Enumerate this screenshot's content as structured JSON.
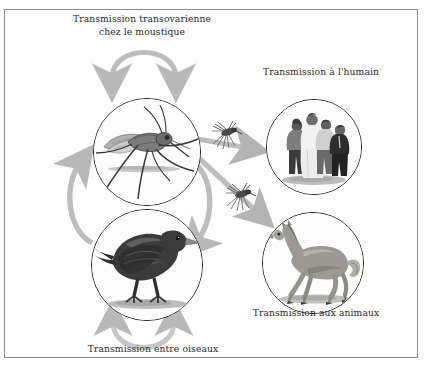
{
  "diagram": {
    "title_text": "Cycle de transmission du virus du Nil occidental",
    "background_color": "#ffffff",
    "border_color": "#8b8b8b",
    "arrow_color": "#b9b9b9",
    "arrow_color_dark": "#a3a3a3",
    "text_color": "#2a2a2a",
    "labels": [
      {
        "id": "transovarial",
        "line1": "Transmission transovarienne",
        "line2": "chez le moustique",
        "full": "Transmission transovarienne chez le moustique"
      },
      {
        "id": "human",
        "line1": "Transmission à l'humain",
        "line2": "",
        "full": "Transmission à l'humain"
      },
      {
        "id": "animals",
        "line1": "Transmission aux animaux",
        "line2": "",
        "full": "Transmission aux animaux"
      },
      {
        "id": "birds",
        "line1": "Transmission entre oiseaux",
        "line2": "",
        "full": "Transmission entre oiseaux"
      }
    ],
    "nodes": [
      {
        "id": "mosquito",
        "icon": "mosquito-photo-icon",
        "alt": "Moustique"
      },
      {
        "id": "bird",
        "icon": "crow-photo-icon",
        "alt": "Oiseau (corneille)"
      },
      {
        "id": "humans",
        "icon": "people-group-photo-icon",
        "alt": "Groupe de personnes"
      },
      {
        "id": "horse",
        "icon": "horse-photo-icon",
        "alt": "Cheval"
      }
    ],
    "arrows": [
      {
        "id": "arrow-transovarial",
        "shape": "arch-down-both",
        "from": "mosquito",
        "to": "mosquito"
      },
      {
        "id": "arrow-bird-loop",
        "shape": "arch-up-both",
        "from": "bird",
        "to": "bird"
      },
      {
        "id": "arrow-mosquito-to-bird",
        "shape": "curve-right-down",
        "from": "mosquito",
        "to": "bird"
      },
      {
        "id": "arrow-bird-to-mosquito",
        "shape": "curve-left-up",
        "from": "bird",
        "to": "mosquito"
      },
      {
        "id": "arrow-mosquito-to-human",
        "shape": "straight-diagonal",
        "from": "mosquito",
        "to": "humans"
      },
      {
        "id": "arrow-mosquito-to-animal",
        "shape": "straight-diagonal",
        "from": "mosquito",
        "to": "horse"
      }
    ],
    "vector_icons": [
      {
        "id": "mini-mosquito-1",
        "icon": "mosquito-vector-icon"
      },
      {
        "id": "mini-mosquito-2",
        "icon": "mosquito-vector-icon"
      }
    ]
  }
}
